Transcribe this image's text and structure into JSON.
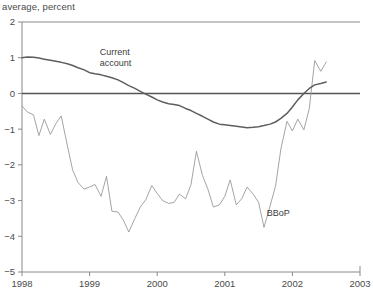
{
  "chart_data": {
    "type": "line",
    "title": "average, percent",
    "xlabel": "",
    "ylabel": "average, percent",
    "xlim": [
      1998,
      2003
    ],
    "ylim": [
      -5,
      2
    ],
    "grid": false,
    "legend_position": "inline-annotations",
    "x_ticks": [
      "1998",
      "1999",
      "2000",
      "2001",
      "2002",
      "2003"
    ],
    "x_tick_values": [
      1998,
      1999,
      2000,
      2001,
      2002,
      2003
    ],
    "y_ticks": [
      "2",
      "1",
      "0",
      "−1",
      "−2",
      "−3",
      "−4",
      "−5"
    ],
    "y_tick_values": [
      2,
      1,
      0,
      -1,
      -2,
      -3,
      -4,
      -5
    ],
    "zero_reference_line": 0,
    "annotations": [
      {
        "text": "Current\naccount",
        "line1": "Current",
        "line2": "account",
        "x": 1999.15,
        "y": 1.08,
        "series": "Current account"
      },
      {
        "text": "BBoP",
        "x": 2001.62,
        "y": -3.42,
        "series": "BBoP"
      }
    ],
    "series": [
      {
        "name": "Current account",
        "color": "#5e5e5e",
        "x": [
          1998.0,
          1998.08,
          1998.17,
          1998.25,
          1998.33,
          1998.42,
          1998.5,
          1998.58,
          1998.67,
          1998.75,
          1998.83,
          1998.92,
          1999.0,
          1999.08,
          1999.17,
          1999.25,
          1999.33,
          1999.42,
          1999.5,
          1999.58,
          1999.67,
          1999.75,
          1999.83,
          1999.92,
          2000.0,
          2000.08,
          2000.17,
          2000.25,
          2000.33,
          2000.42,
          2000.5,
          2000.58,
          2000.67,
          2000.75,
          2000.83,
          2000.92,
          2001.0,
          2001.08,
          2001.17,
          2001.25,
          2001.33,
          2001.42,
          2001.5,
          2001.58,
          2001.67,
          2001.75,
          2001.83,
          2001.92,
          2002.0,
          2002.08,
          2002.17,
          2002.25,
          2002.33,
          2002.42,
          2002.5
        ],
        "y": [
          1.0,
          1.02,
          1.01,
          0.99,
          0.96,
          0.93,
          0.9,
          0.87,
          0.83,
          0.78,
          0.72,
          0.66,
          0.58,
          0.55,
          0.52,
          0.48,
          0.44,
          0.38,
          0.3,
          0.22,
          0.14,
          0.06,
          -0.02,
          -0.1,
          -0.18,
          -0.24,
          -0.29,
          -0.31,
          -0.34,
          -0.42,
          -0.48,
          -0.56,
          -0.64,
          -0.72,
          -0.8,
          -0.86,
          -0.88,
          -0.9,
          -0.92,
          -0.94,
          -0.96,
          -0.95,
          -0.93,
          -0.9,
          -0.86,
          -0.8,
          -0.7,
          -0.56,
          -0.38,
          -0.18,
          0.0,
          0.14,
          0.24,
          0.28,
          0.32
        ]
      },
      {
        "name": "BBoP",
        "color": "#9a9a9a",
        "x": [
          1998.0,
          1998.08,
          1998.17,
          1998.25,
          1998.33,
          1998.42,
          1998.5,
          1998.58,
          1998.67,
          1998.75,
          1998.83,
          1998.92,
          1999.0,
          1999.08,
          1999.17,
          1999.25,
          1999.33,
          1999.42,
          1999.5,
          1999.58,
          1999.67,
          1999.75,
          1999.83,
          1999.92,
          2000.0,
          2000.08,
          2000.17,
          2000.25,
          2000.33,
          2000.42,
          2000.5,
          2000.58,
          2000.67,
          2000.75,
          2000.83,
          2000.92,
          2001.0,
          2001.08,
          2001.17,
          2001.25,
          2001.33,
          2001.42,
          2001.5,
          2001.58,
          2001.67,
          2001.75,
          2001.83,
          2001.92,
          2002.0,
          2002.08,
          2002.17,
          2002.25,
          2002.33,
          2002.42,
          2002.5
        ],
        "y": [
          -0.35,
          -0.52,
          -0.6,
          -1.18,
          -0.72,
          -1.15,
          -0.85,
          -0.63,
          -1.45,
          -2.15,
          -2.5,
          -2.68,
          -2.62,
          -2.55,
          -2.88,
          -2.32,
          -3.3,
          -3.32,
          -3.55,
          -3.88,
          -3.5,
          -3.18,
          -2.98,
          -2.58,
          -2.8,
          -3.0,
          -3.08,
          -3.05,
          -2.82,
          -2.95,
          -2.55,
          -1.62,
          -2.3,
          -2.68,
          -3.18,
          -3.12,
          -2.88,
          -2.42,
          -3.12,
          -2.95,
          -2.62,
          -2.82,
          -3.05,
          -3.75,
          -3.15,
          -2.6,
          -1.55,
          -0.78,
          -1.05,
          -0.72,
          -1.02,
          -0.42,
          0.92,
          0.62,
          0.88
        ]
      }
    ]
  },
  "plot_geometry": {
    "left": 22,
    "right": 360,
    "top": 22,
    "bottom": 272
  }
}
